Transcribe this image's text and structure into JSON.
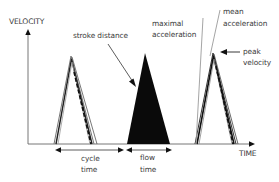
{
  "diagram": {
    "type": "velocity-time stroke cycle diagram",
    "axes": {
      "y_label": "VELOCITY",
      "x_label": "TIME"
    },
    "annotations": {
      "stroke_distance": "stroke distance",
      "maximal_acceleration_line1": "maximal",
      "maximal_acceleration_line2": "acceleration",
      "mean_acceleration_line1": "mean",
      "mean_acceleration_line2": "acceleration",
      "peak_velocity_line1": "peak",
      "peak_velocity_line2": "velocity",
      "cycle_time_line1": "cycle",
      "cycle_time_line2": "time",
      "flow_time_line1": "flow",
      "flow_time_line2": "time"
    },
    "colors": {
      "background": "#ffffff",
      "ink": "#111111",
      "axis": "#555555",
      "text": "#3a3a3a",
      "guide_line": "#9a9a9a"
    },
    "shapes": [
      {
        "name": "cycle-triangle-outlined",
        "style": "outlined multi-stroke"
      },
      {
        "name": "flow-triangle-filled",
        "style": "solid black fill"
      },
      {
        "name": "peak-triangle-outlined",
        "style": "outlined multi-stroke"
      }
    ]
  }
}
